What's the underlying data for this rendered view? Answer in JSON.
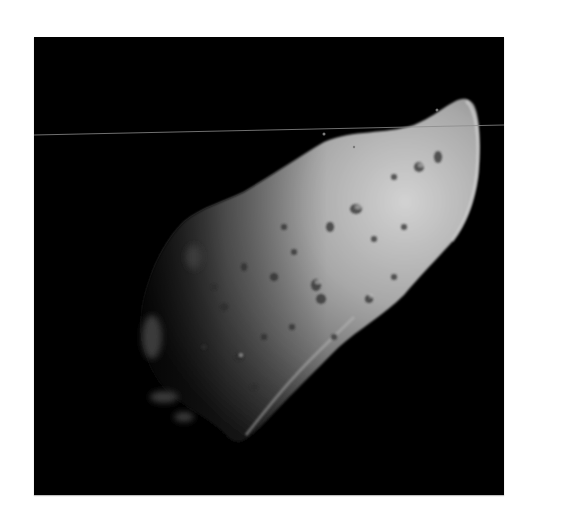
{
  "image": {
    "subject": "asteroid",
    "description": "Grayscale spacecraft photograph of an elongated, cratered asteroid lit from the right against black space",
    "background_color": "#ffffff",
    "frame_color": "#000000",
    "surface_highlight": "#cfcfcf",
    "surface_mid": "#8a8a8a",
    "surface_shadow": "#2a2a2a",
    "scan_line_color": "#8c8c8c"
  }
}
